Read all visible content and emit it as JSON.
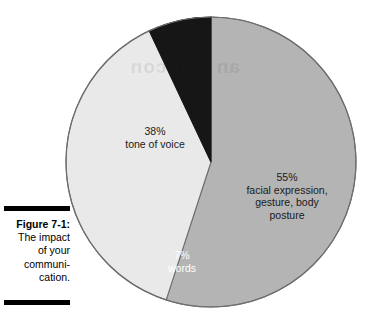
{
  "figure": {
    "label": "Figure 7-1:",
    "caption_lines": [
      "The impact",
      "of your",
      "communi-",
      "cation."
    ],
    "rule_color": "#000000"
  },
  "bleed_through": {
    "text": "an you con"
  },
  "chart_data": {
    "type": "pie",
    "categories": [
      "facial expression, gesture, body posture",
      "tone of voice",
      "words"
    ],
    "values": [
      55,
      38,
      7
    ],
    "value_labels": [
      "55%",
      "38%",
      "7%"
    ],
    "colors": [
      "#b4b4b4",
      "#e9e9e9",
      "#161616"
    ],
    "label_text_colors": [
      "#1a1a1a",
      "#1a1a1a",
      "#ffffff"
    ],
    "start_angle_deg": 0,
    "direction": "clockwise",
    "legend": "none",
    "grid": false,
    "slices": [
      {
        "percent_label": "55%",
        "desc_lines": [
          "facial expression,",
          "gesture, body",
          "posture"
        ],
        "value": 55,
        "color": "#b4b4b4",
        "text_color": "#1a1a1a"
      },
      {
        "percent_label": "38%",
        "desc_lines": [
          "tone of voice"
        ],
        "value": 38,
        "color": "#e9e9e9",
        "text_color": "#1a1a1a"
      },
      {
        "percent_label": "7%",
        "desc_lines": [
          "words"
        ],
        "value": 7,
        "color": "#161616",
        "text_color": "#ffffff"
      }
    ],
    "outline_color": "#6e6e6e",
    "center": {
      "x": 151,
      "y": 154
    },
    "radius": 145
  }
}
